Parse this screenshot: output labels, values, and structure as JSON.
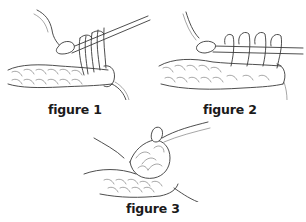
{
  "figures": [
    {
      "id": "figure-1",
      "label": "figure 1",
      "description": "crochet hook with multiple loops on hook above foundation row"
    },
    {
      "id": "figure-2",
      "label": "figure 2",
      "description": "crochet hook with loops on hook, yarn pulled through stitches of row"
    },
    {
      "id": "figure-3",
      "label": "figure 3",
      "description": "completed cluster / puff stitch gathered on top of row"
    }
  ],
  "colors": {
    "line": "#3a3a3a",
    "background": "#ffffff",
    "label": "#1a1a1a"
  }
}
